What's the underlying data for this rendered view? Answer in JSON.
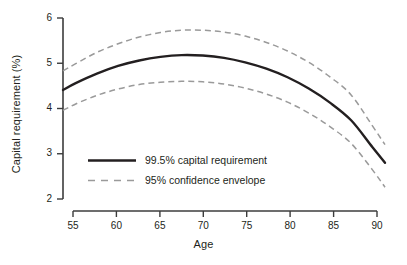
{
  "chart_data": {
    "type": "line",
    "title": "",
    "xlabel": "Age",
    "ylabel": "Capital requirement (%)",
    "xlim": [
      53.5,
      91.5
    ],
    "ylim": [
      2,
      6
    ],
    "grid": false,
    "legend_position": "inside-lower-left",
    "xticks": [
      55,
      60,
      65,
      70,
      75,
      80,
      85,
      90
    ],
    "xtick_labels": [
      "55",
      "60",
      "65",
      "70",
      "75",
      "80",
      "85",
      "90"
    ],
    "yticks": [
      2,
      3,
      4,
      5,
      6
    ],
    "ytick_labels": [
      "2",
      "3",
      "4",
      "5",
      "6"
    ],
    "x": [
      53.5,
      55,
      57.5,
      60,
      62.5,
      65,
      67.5,
      70,
      72.5,
      75,
      77.5,
      80,
      82.5,
      85,
      87.5,
      90,
      91.5
    ],
    "series": [
      {
        "name": "99.5% capital requirement",
        "style": "solid",
        "color": "#231f20",
        "width": 2.4,
        "values": [
          4.41,
          4.56,
          4.77,
          4.94,
          5.06,
          5.14,
          5.18,
          5.17,
          5.12,
          5.02,
          4.88,
          4.69,
          4.44,
          4.13,
          3.74,
          3.15,
          2.8
        ]
      },
      {
        "name": "95% confidence envelope upper",
        "style": "dashed",
        "color": "#9a9a9a",
        "width": 1.5,
        "values": [
          4.83,
          4.99,
          5.24,
          5.43,
          5.58,
          5.68,
          5.73,
          5.73,
          5.69,
          5.6,
          5.46,
          5.27,
          5.02,
          4.7,
          4.3,
          3.62,
          3.2
        ]
      },
      {
        "name": "95% confidence envelope lower",
        "style": "dashed",
        "color": "#9a9a9a",
        "width": 1.5,
        "values": [
          3.96,
          4.1,
          4.29,
          4.43,
          4.53,
          4.58,
          4.6,
          4.59,
          4.54,
          4.45,
          4.32,
          4.14,
          3.9,
          3.6,
          3.23,
          2.65,
          2.26
        ]
      }
    ],
    "legend": [
      {
        "label": "99.5% capital requirement",
        "style": "solid",
        "color": "#231f20"
      },
      {
        "label": "95% confidence envelope",
        "style": "dashed",
        "color": "#9a9a9a"
      }
    ]
  },
  "colors": {
    "solid_line": "#231f20",
    "dashed_line": "#9a9a9a",
    "axis": "#3c3c3c",
    "text": "#231f20",
    "background": "#ffffff"
  }
}
